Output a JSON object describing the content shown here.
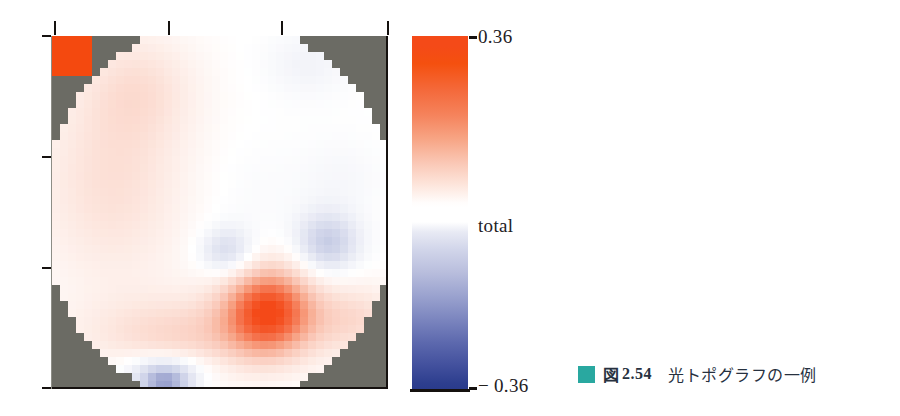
{
  "figure": {
    "caption_marker_color": "#29a8a0",
    "caption_fig_label": "図",
    "caption_fig_number": "2.54",
    "caption_text": "光トポグラフの一例"
  },
  "colorbar": {
    "max_label": "0.36",
    "mid_label": "total",
    "min_label": "− 0.36",
    "positive_color": "#f44a18",
    "negative_color": "#2a3b8c",
    "neutral_color": "#ffffff"
  },
  "plot": {
    "background_color": "#6b6b64",
    "frame_color": "#15110f",
    "top_ticks_x": [
      54,
      168,
      281,
      387
    ],
    "left_ticks_y": [
      36,
      157,
      268,
      388
    ]
  },
  "chart_data": {
    "type": "heatmap",
    "title": "",
    "xlabel": "",
    "ylabel": "",
    "colormap": "red-white-blue (diverging)",
    "vmin": -0.36,
    "vmax": 0.36,
    "unit_label": "total",
    "grid": false,
    "legend": "vertical colorbar at right",
    "mask": "circular head-shaped region; corners masked in grey",
    "mask_color": "#6b6b64",
    "nx": 42,
    "ny": 44,
    "corner_marker": {
      "note": "solid saturated red calibration block at top-left corner",
      "x0": 0,
      "y0": 0,
      "x1": 5,
      "y1": 5,
      "value": 0.36,
      "color": "#f4490f"
    },
    "blobs": [
      {
        "name": "left-temporal-warm",
        "cx": 0.18,
        "cy": 0.42,
        "rx": 0.3,
        "ry": 0.38,
        "amp": 0.085
      },
      {
        "name": "upper-left-warm",
        "cx": 0.26,
        "cy": 0.14,
        "rx": 0.22,
        "ry": 0.2,
        "amp": 0.065
      },
      {
        "name": "upper-right-cool",
        "cx": 0.76,
        "cy": 0.08,
        "rx": 0.16,
        "ry": 0.12,
        "amp": -0.035
      },
      {
        "name": "mid-right-cool-faint",
        "cx": 0.86,
        "cy": 0.4,
        "rx": 0.16,
        "ry": 0.14,
        "amp": -0.022
      },
      {
        "name": "central-cool-spot",
        "cx": 0.52,
        "cy": 0.61,
        "rx": 0.1,
        "ry": 0.085,
        "amp": -0.115
      },
      {
        "name": "right-cool-spot",
        "cx": 0.82,
        "cy": 0.585,
        "rx": 0.115,
        "ry": 0.105,
        "amp": -0.15
      },
      {
        "name": "lower-central-hot",
        "cx": 0.645,
        "cy": 0.775,
        "rx": 0.165,
        "ry": 0.155,
        "amp": 0.33
      },
      {
        "name": "lower-band-warm",
        "cx": 0.42,
        "cy": 0.845,
        "rx": 0.4,
        "ry": 0.14,
        "amp": 0.105
      },
      {
        "name": "bottom-left-cool",
        "cx": 0.335,
        "cy": 0.985,
        "rx": 0.105,
        "ry": 0.06,
        "amp": -0.23
      },
      {
        "name": "bottom-white-halo",
        "cx": 0.335,
        "cy": 0.935,
        "rx": 0.175,
        "ry": 0.055,
        "amp": -0.085
      },
      {
        "name": "lower-right-warm",
        "cx": 0.9,
        "cy": 0.8,
        "rx": 0.18,
        "ry": 0.13,
        "amp": 0.09
      },
      {
        "name": "mid-white-channel",
        "cx": 0.58,
        "cy": 0.46,
        "rx": 0.22,
        "ry": 0.22,
        "amp": -0.015
      }
    ]
  }
}
